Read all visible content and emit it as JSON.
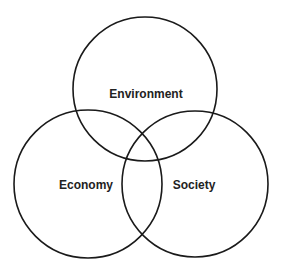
{
  "diagram": {
    "type": "venn",
    "stroke_color": "#1a1a1a",
    "circles": [
      {
        "id": "environment",
        "label": "Environment",
        "cx": 145,
        "cy": 89,
        "r": 72
      },
      {
        "id": "economy",
        "label": "Economy",
        "cx": 88,
        "cy": 184,
        "r": 74
      },
      {
        "id": "society",
        "label": "Society",
        "cx": 195,
        "cy": 184,
        "r": 73
      }
    ]
  }
}
